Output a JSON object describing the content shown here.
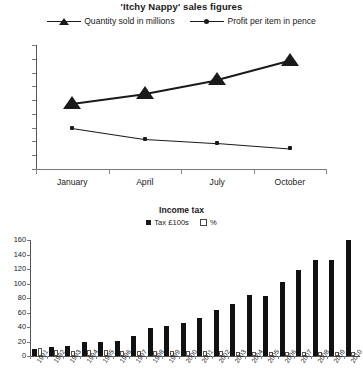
{
  "chart_data": [
    {
      "type": "line",
      "title": "'Itchy Nappy' sales figures",
      "categories": [
        "January",
        "April",
        "July",
        "October"
      ],
      "series": [
        {
          "name": "Quantity sold in millions",
          "marker": "triangle",
          "values": [
            48,
            55,
            65,
            79
          ]
        },
        {
          "name": "Profit per item in pence",
          "marker": "circle",
          "values": [
            30,
            22,
            19,
            15
          ]
        }
      ],
      "ylim": [
        0,
        90
      ],
      "yticks": [
        0,
        10,
        20,
        30,
        40,
        50,
        60,
        70,
        80,
        90
      ],
      "xlabel": "",
      "ylabel": "",
      "grid": false,
      "legend_position": "top"
    },
    {
      "type": "bar",
      "title": "Income tax",
      "categories": [
        "1991",
        "1992",
        "1993",
        "1994",
        "1995",
        "1996",
        "1997",
        "1998",
        "1999",
        "2000",
        "2001",
        "2002",
        "2003",
        "2004",
        "2005",
        "2006",
        "2007",
        "2008",
        "2009",
        "2010"
      ],
      "series": [
        {
          "name": "Tax £100s",
          "fill": "solid",
          "values": [
            10,
            13,
            14,
            19,
            20,
            21,
            28,
            38,
            41,
            45,
            53,
            63,
            72,
            84,
            83,
            102,
            118,
            133,
            132,
            160
          ]
        },
        {
          "name": "%",
          "fill": "open",
          "values": [
            11,
            8,
            7,
            8,
            8,
            7,
            7,
            7,
            7,
            7,
            7,
            7,
            6,
            6,
            6,
            6,
            6,
            6,
            6,
            6
          ]
        }
      ],
      "ylim": [
        0,
        160
      ],
      "yticks": [
        0,
        20,
        40,
        60,
        80,
        100,
        120,
        140,
        160
      ],
      "xlabel": "",
      "ylabel": "",
      "grid": false,
      "legend_position": "top"
    }
  ]
}
